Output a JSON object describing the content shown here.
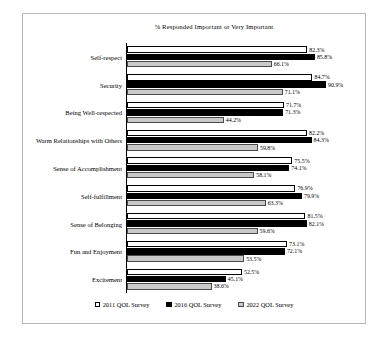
{
  "chart_data": {
    "type": "bar",
    "orientation": "horizontal",
    "title": "% Responded Important or Very Important",
    "xlabel": "",
    "ylabel": "",
    "xlim": [
      0,
      100
    ],
    "grid": false,
    "legend_position": "bottom",
    "categories": [
      "Self-respect",
      "Security",
      "Being Well-respected",
      "Warm Relationships with Others",
      "Sense of Accomplishment",
      "Self-fulfillment",
      "Sense of Belonging",
      "Fun and Enjoyment",
      "Excitement"
    ],
    "series": [
      {
        "name": "2011 QOL Survey",
        "color": "#ffffff",
        "values": [
          82.3,
          84.7,
          71.7,
          82.2,
          75.5,
          76.9,
          81.5,
          73.1,
          52.5
        ],
        "labels": [
          "82.3%",
          "84.7%",
          "71.7%",
          "82.2%",
          "75.5%",
          "76.9%",
          "81.5%",
          "73.1%",
          "52.5%"
        ]
      },
      {
        "name": "2016 QOL Survey",
        "color": "#000000",
        "values": [
          85.8,
          90.9,
          71.3,
          84.3,
          74.1,
          79.9,
          82.1,
          72.1,
          45.1
        ],
        "labels": [
          "85.8%",
          "90.9%",
          "71.3%",
          "84.3%",
          "74.1%",
          "79.9%",
          "82.1%",
          "72.1%",
          "45.1%"
        ]
      },
      {
        "name": "2022 QOL Survey",
        "color": "#c9c9c9",
        "values": [
          66.1,
          71.1,
          44.2,
          59.8,
          58.1,
          63.3,
          59.6,
          53.5,
          38.6
        ],
        "labels": [
          "66.1%",
          "71.1%",
          "44.2%",
          "59.8%",
          "58.1%",
          "63.3%",
          "59.6%",
          "53.5%",
          "38.6%"
        ]
      }
    ]
  }
}
